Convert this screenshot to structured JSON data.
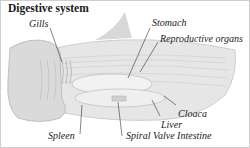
{
  "title": "Digestive system",
  "labels": {
    "gills": "Gills",
    "stomach": "Stomach",
    "reproductive": "Reproductive organs",
    "cloaca": "Cloaca",
    "liver": "Liver",
    "spleen": "Spleen",
    "spiral_valve": "Spiral Valve Intestine"
  },
  "colors": {
    "background": "#ffffff",
    "border": "#cfcfcf",
    "text": "#222222"
  }
}
